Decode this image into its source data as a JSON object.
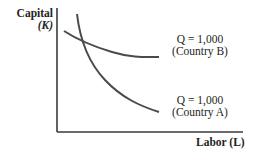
{
  "diagram": {
    "type": "isoquant",
    "axes": {
      "y_label_line1": "Capital",
      "y_label_line2": "(K)",
      "x_label": "Labor (L)"
    },
    "curves": [
      {
        "id": "country-b",
        "label_line1": "Q = 1,000",
        "label_line2": "(Country B)",
        "shape": "flatter isoquant"
      },
      {
        "id": "country-a",
        "label_line1": "Q = 1,000",
        "label_line2": "(Country A)",
        "shape": "steeper isoquant"
      }
    ],
    "colors": {
      "axis": "#3a3a3a",
      "curve": "#4a4a4a",
      "text": "#231f20"
    }
  }
}
